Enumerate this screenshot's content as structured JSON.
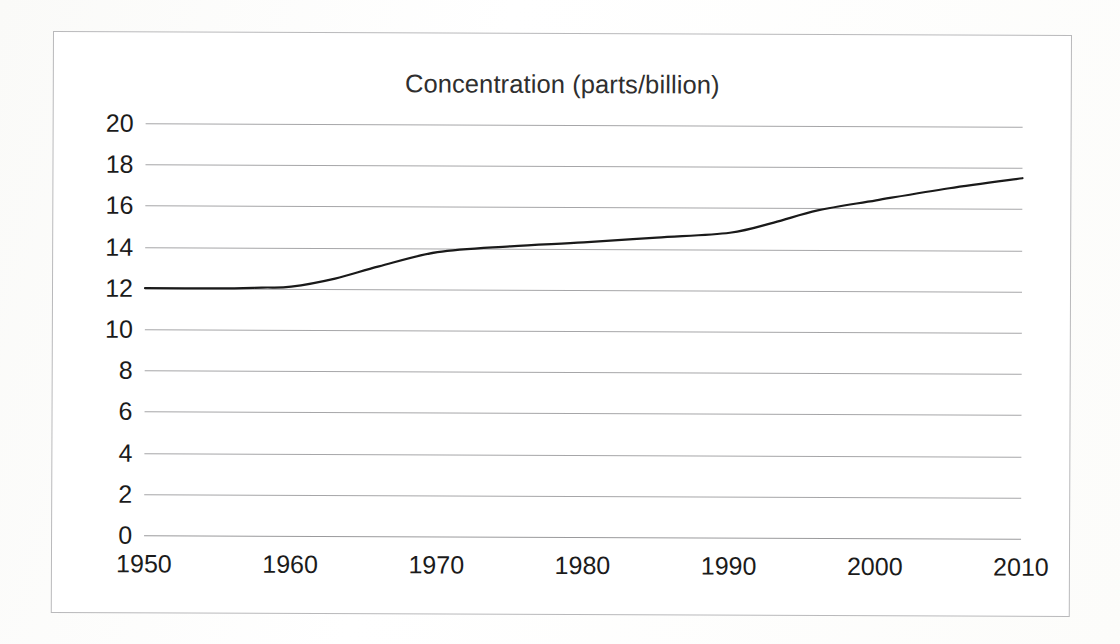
{
  "chart_data": {
    "type": "line",
    "title": "Concentration (parts/billion)",
    "xlabel": "",
    "ylabel": "",
    "x": [
      1950,
      1960,
      1970,
      1980,
      1990,
      2000,
      2010
    ],
    "xtick_labels": [
      "1950",
      "1960",
      "1970",
      "1980",
      "1990",
      "2000",
      "2010"
    ],
    "ytick_labels": [
      "20",
      "18",
      "16",
      "14",
      "12",
      "10",
      "8",
      "6",
      "4",
      "2",
      "0"
    ],
    "ytick_values": [
      20,
      18,
      16,
      14,
      12,
      10,
      8,
      6,
      4,
      2,
      0
    ],
    "xlim": [
      1950,
      2010
    ],
    "ylim": [
      0,
      20
    ],
    "grid": "horizontal",
    "legend": "none",
    "series": [
      {
        "name": "Concentration",
        "color": "#1a1a1a",
        "line_width": 2.2,
        "smoothed": true,
        "values": [
          12.0,
          12.1,
          13.8,
          14.3,
          14.8,
          16.4,
          17.5
        ]
      }
    ],
    "detail_points": [
      {
        "x": 1950,
        "y": 12.0
      },
      {
        "x": 1955,
        "y": 12.0
      },
      {
        "x": 1958,
        "y": 12.05
      },
      {
        "x": 1960,
        "y": 12.1
      },
      {
        "x": 1963,
        "y": 12.5
      },
      {
        "x": 1966,
        "y": 13.1
      },
      {
        "x": 1970,
        "y": 13.8
      },
      {
        "x": 1975,
        "y": 14.1
      },
      {
        "x": 1980,
        "y": 14.3
      },
      {
        "x": 1985,
        "y": 14.55
      },
      {
        "x": 1990,
        "y": 14.8
      },
      {
        "x": 1993,
        "y": 15.3
      },
      {
        "x": 1996,
        "y": 15.9
      },
      {
        "x": 2000,
        "y": 16.4
      },
      {
        "x": 2005,
        "y": 17.0
      },
      {
        "x": 2010,
        "y": 17.5
      }
    ]
  },
  "chart": {
    "title": "Concentration (parts/billion)"
  }
}
